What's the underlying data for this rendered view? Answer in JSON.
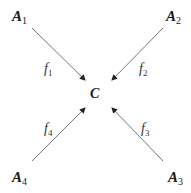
{
  "diagram": {
    "center": {
      "label": "C"
    },
    "nodes": [
      {
        "id": "A1",
        "base": "A",
        "sub": "1"
      },
      {
        "id": "A2",
        "base": "A",
        "sub": "2"
      },
      {
        "id": "A3",
        "base": "A",
        "sub": "3"
      },
      {
        "id": "A4",
        "base": "A",
        "sub": "4"
      }
    ],
    "edges": [
      {
        "from": "A1",
        "to": "C",
        "base": "f",
        "sub": "1"
      },
      {
        "from": "A2",
        "to": "C",
        "base": "f",
        "sub": "2"
      },
      {
        "from": "A3",
        "to": "C",
        "base": "f",
        "sub": "3"
      },
      {
        "from": "A4",
        "to": "C",
        "base": "f",
        "sub": "4"
      }
    ],
    "colors": {
      "arrow": "#555555",
      "text": "#1a1a1a"
    }
  }
}
